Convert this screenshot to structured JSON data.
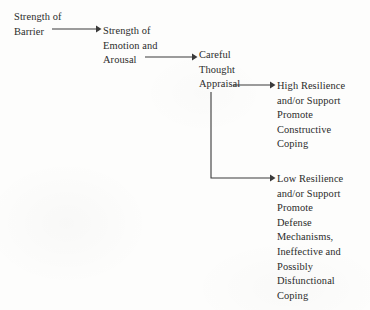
{
  "diagram": {
    "type": "flowchart",
    "ink_color": "#2b2b2b",
    "background_color": "#fdfdfc",
    "nodes": [
      {
        "id": "barrier",
        "lines": [
          "Strength of",
          "Barrier"
        ],
        "x": 14,
        "y": 10
      },
      {
        "id": "emotion",
        "lines": [
          "Strength of",
          "Emotion and",
          "Arousal"
        ],
        "x": 103,
        "y": 24
      },
      {
        "id": "appraisal",
        "lines": [
          "Careful",
          "Thought",
          "Appraisal"
        ],
        "x": 199,
        "y": 48
      },
      {
        "id": "high-resilience",
        "lines": [
          "High Resilience",
          "and/or Support",
          "Promote",
          "Constructive",
          "Coping"
        ],
        "x": 277,
        "y": 79
      },
      {
        "id": "low-resilience",
        "lines": [
          "Low Resilience",
          "and/or Support",
          "Promote",
          "Defense",
          "Mechanisms,",
          "Ineffective and",
          "Possibly",
          "Disfunctional",
          "Coping"
        ],
        "x": 277,
        "y": 172
      }
    ],
    "connectors": [
      {
        "id": "barrier-to-emotion",
        "from": "barrier",
        "to": "emotion",
        "kind": "straight",
        "x1": 52,
        "y1": 29,
        "x2": 100,
        "y2": 29
      },
      {
        "id": "emotion-to-appraisal",
        "from": "emotion",
        "to": "appraisal",
        "kind": "straight",
        "x1": 145,
        "y1": 57,
        "x2": 196,
        "y2": 57
      },
      {
        "id": "appraisal-to-high-resilience",
        "from": "appraisal",
        "to": "high-resilience",
        "kind": "straight",
        "x1": 233,
        "y1": 85,
        "x2": 274,
        "y2": 85
      },
      {
        "id": "appraisal-to-low-resilience",
        "from": "appraisal",
        "to": "low-resilience",
        "kind": "elbow",
        "x1": 211,
        "y1": 92,
        "corner_y": 178,
        "x2": 274,
        "y2": 178
      }
    ]
  }
}
